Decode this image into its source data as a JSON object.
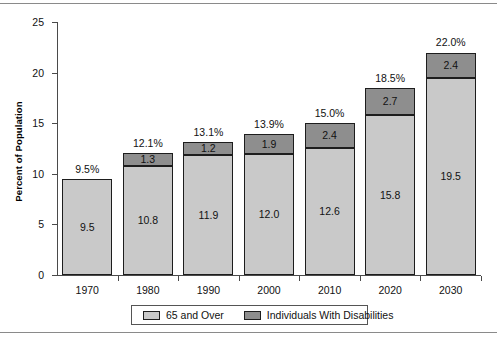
{
  "chart_data": {
    "type": "bar",
    "subtype": "stacked",
    "title": "",
    "xlabel": "",
    "ylabel": "Percent of Population",
    "categories": [
      "1970",
      "1980",
      "1990",
      "2000",
      "2010",
      "2020",
      "2030"
    ],
    "series": [
      {
        "name": "65 and Over",
        "color": "#c9c9c9",
        "values": [
          9.5,
          10.8,
          11.9,
          12.0,
          12.6,
          15.8,
          19.5
        ],
        "labels": [
          "9.5",
          "10.8",
          "11.9",
          "12.0",
          "12.6",
          "15.8",
          "19.5"
        ]
      },
      {
        "name": "Individuals With Disabilities",
        "color": "#8e8e8e",
        "values": [
          0.0,
          1.3,
          1.2,
          1.9,
          2.4,
          2.7,
          2.4
        ],
        "labels": [
          "",
          "1.3",
          "1.2",
          "1.9",
          "2.4",
          "2.7",
          "2.4"
        ]
      }
    ],
    "totals": [
      9.5,
      12.1,
      13.1,
      13.9,
      15.0,
      18.5,
      22.0
    ],
    "total_labels": [
      "9.5%",
      "12.1%",
      "13.1%",
      "13.9%",
      "15.0%",
      "18.5%",
      "22.0%"
    ],
    "ylim": [
      0,
      25
    ],
    "yticks": [
      0,
      5,
      10,
      15,
      20,
      25
    ],
    "ytick_labels": [
      "0",
      "5",
      "10",
      "15",
      "20",
      "25"
    ],
    "grid": false,
    "legend_position": "bottom"
  },
  "legend": {
    "entries": [
      {
        "label": "65 and Over",
        "color": "#c9c9c9"
      },
      {
        "label": "Individuals With Disabilities",
        "color": "#8e8e8e"
      }
    ]
  },
  "colors": {
    "series_65_and_over": "#c9c9c9",
    "series_disabilities": "#8e8e8e",
    "axis": "#4a4a4a",
    "bar_outline": "#1d1d1d",
    "text": "#111111",
    "page_rule": "#8a8a8a",
    "background": "#ffffff"
  }
}
